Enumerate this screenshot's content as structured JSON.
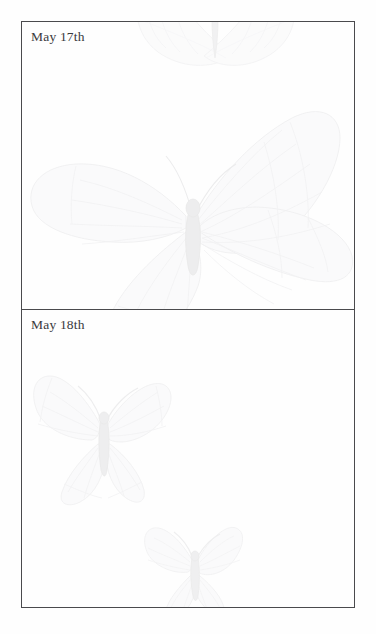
{
  "document": {
    "type": "journal-page",
    "background_color": "#ffffff",
    "sheet_color": "#fefefe",
    "border_color": "#4a4a4d",
    "text_color": "#3a3a3d",
    "watermark_color": "#ececed"
  },
  "entries": [
    {
      "date_label": "May 17th",
      "body_text": "",
      "watermarks": [
        {
          "name": "butterfly-large",
          "position": "center"
        },
        {
          "name": "butterfly-partial-wing",
          "position": "top-center"
        }
      ]
    },
    {
      "date_label": "May 18th",
      "body_text": "",
      "watermarks": [
        {
          "name": "butterfly-medium",
          "position": "left-center"
        },
        {
          "name": "butterfly-small",
          "position": "bottom-center"
        }
      ]
    }
  ]
}
